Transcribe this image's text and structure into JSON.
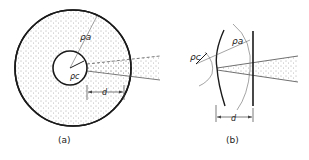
{
  "figure": {
    "panel_a": {
      "caption": "(a)",
      "labels": {
        "rho_a": "ρa",
        "rho_c": "ρc",
        "d": "d"
      }
    },
    "panel_b": {
      "caption": "(b)",
      "labels": {
        "rho_a": "ρa",
        "rho_c": "ρc",
        "d": "d"
      }
    },
    "colors": {
      "line": "#1a1a1a",
      "stipple": "#555555",
      "thin": "#666666"
    }
  }
}
